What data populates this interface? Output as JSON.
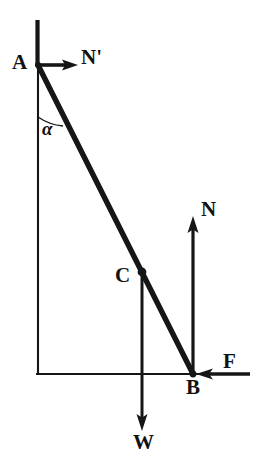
{
  "figure": {
    "ink_color": "#161616",
    "background_color": "#ffffff",
    "width": 257,
    "height": 469
  },
  "points": {
    "A": {
      "label": "A",
      "x": 38,
      "y": 65,
      "description": "top of ladder at wall"
    },
    "B": {
      "label": "B",
      "x": 193,
      "y": 374,
      "description": "foot of ladder on ground"
    },
    "C": {
      "label": "C",
      "x": 142,
      "y": 272,
      "description": "center of gravity of ladder"
    }
  },
  "forces": [
    {
      "name": "N-prime",
      "label": "N'",
      "direction": "right",
      "from_x": 38,
      "from_y": 65,
      "to_x": 78,
      "to_y": 65,
      "applied_at": "A"
    },
    {
      "name": "N",
      "label": "N",
      "direction": "up",
      "from_x": 193,
      "from_y": 374,
      "to_x": 193,
      "to_y": 218,
      "applied_at": "B"
    },
    {
      "name": "F",
      "label": "F",
      "direction": "left",
      "from_x": 250,
      "from_y": 374,
      "to_x": 197,
      "to_y": 374,
      "applied_at": "B"
    },
    {
      "name": "W",
      "label": "W",
      "direction": "down",
      "from_x": 142,
      "from_y": 272,
      "to_x": 142,
      "to_y": 430,
      "applied_at": "C"
    }
  ],
  "angle": {
    "label": "α",
    "name": "alpha",
    "vertex": "A",
    "between": "wall and ladder"
  },
  "structure": {
    "wall": {
      "x": 38,
      "y_top": 20,
      "y_bottom": 374
    },
    "ground": {
      "y": 374,
      "x_left": 36,
      "x_right": 250
    },
    "ladder": {
      "from": "A",
      "to": "B"
    }
  }
}
